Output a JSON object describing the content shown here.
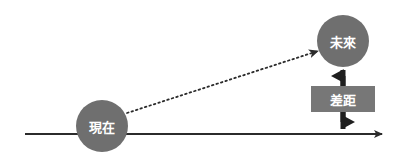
{
  "diagram": {
    "type": "timeline-gap-diagram",
    "background_color": "#ffffff",
    "colors": {
      "node_fill": "#6f6f6f",
      "box_fill": "#777777",
      "axis_stroke": "#2b2b2b",
      "dotted_stroke": "#2b2b2b",
      "label_text": "#ffffff"
    },
    "axis": {
      "name": "time-axis",
      "x_start": 25,
      "x_end": 386,
      "y": 134,
      "stroke_width": 2,
      "arrow": "right"
    },
    "nodes": [
      {
        "id": "present",
        "label": "現在",
        "cx": 102,
        "cy": 126,
        "r": 26,
        "fill": "#6f6f6f"
      },
      {
        "id": "future",
        "label": "未來",
        "cx": 343,
        "cy": 41,
        "r": 26,
        "fill": "#6f6f6f"
      }
    ],
    "connector": {
      "name": "present-to-future-dotted-arrow",
      "style": "dotted",
      "x1": 127,
      "y1": 113,
      "x2": 320,
      "y2": 50,
      "arrow": "end"
    },
    "gap_measure": {
      "name": "gap-double-arrow",
      "label": "差距",
      "x": 343,
      "y_top": 63,
      "y_bottom": 134,
      "arrow": "both",
      "box": {
        "x": 311,
        "y": 86,
        "width": 64,
        "height": 26,
        "fill": "#777777"
      }
    }
  }
}
